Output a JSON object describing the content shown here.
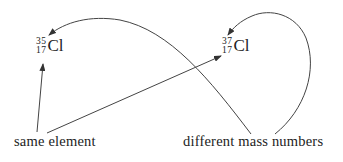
{
  "isotopes": [
    {
      "mass_number": "35",
      "atomic_number": "17",
      "symbol": "Cl"
    },
    {
      "mass_number": "37",
      "atomic_number": "17",
      "symbol": "Cl"
    }
  ],
  "labels": {
    "same_element": "same element",
    "different_mass_numbers": "different mass numbers"
  },
  "colors": {
    "line": "#444444",
    "text": "#222222",
    "background": "#ffffff"
  }
}
